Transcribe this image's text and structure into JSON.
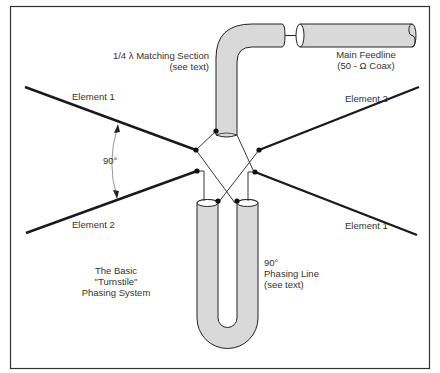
{
  "diagram": {
    "title_lines": [
      "The Basic",
      "\"Turnstile\"",
      "Phasing System"
    ],
    "labels": {
      "element1_left": "Element 1",
      "element2_left": "Element 2",
      "element2_right": "Element 2",
      "element1_right": "Element 1",
      "angle": "90°",
      "matching_section_line1": "1/4 λ Matching Section",
      "matching_section_line2": "(see text)",
      "feedline_line1": "Main Feedline",
      "feedline_line2": "(50 - Ω Coax)",
      "phasing_line1": "90°",
      "phasing_line2": "Phasing Line",
      "phasing_line3": "(see text)"
    },
    "colors": {
      "coax_fill": "#d9d9d9",
      "line": "#1a1a1a",
      "border": "#333333",
      "text": "#333333"
    }
  }
}
